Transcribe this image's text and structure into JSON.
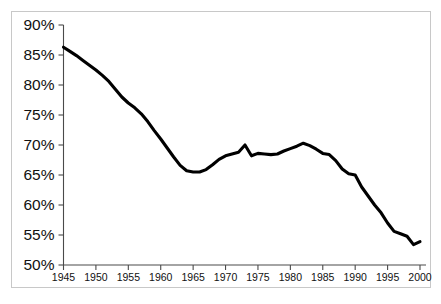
{
  "chart_data": {
    "type": "line",
    "title": "",
    "subtitle": "",
    "xlabel": "",
    "ylabel": "",
    "xlim": [
      1945,
      2000
    ],
    "ylim": [
      50,
      90
    ],
    "grid": false,
    "legend": null,
    "legend_position": "none",
    "line_color": "#000000",
    "axis_color": "#4a4a4a",
    "border_color": "#c8c8c8",
    "background_color": "#ffffff",
    "y_tick_labels": [
      "90%",
      "85%",
      "80%",
      "75%",
      "70%",
      "65%",
      "60%",
      "55%",
      "50%"
    ],
    "y_tick_values": [
      90,
      85,
      80,
      75,
      70,
      65,
      60,
      55,
      50
    ],
    "x_tick_labels": [
      "1945",
      "1950",
      "1955",
      "1960",
      "1965",
      "1970",
      "1975",
      "1980",
      "1985",
      "1990",
      "1995",
      "2000"
    ],
    "x_tick_values": [
      1945,
      1950,
      1955,
      1960,
      1965,
      1970,
      1975,
      1980,
      1985,
      1990,
      1995,
      2000
    ],
    "x": [
      1945,
      1946,
      1947,
      1948,
      1949,
      1950,
      1951,
      1952,
      1953,
      1954,
      1955,
      1956,
      1957,
      1958,
      1959,
      1960,
      1961,
      1962,
      1963,
      1964,
      1965,
      1966,
      1967,
      1968,
      1969,
      1970,
      1971,
      1972,
      1973,
      1974,
      1975,
      1976,
      1977,
      1978,
      1979,
      1980,
      1981,
      1982,
      1983,
      1984,
      1985,
      1986,
      1987,
      1988,
      1989,
      1990,
      1991,
      1992,
      1993,
      1994,
      1995,
      1996,
      1997,
      1998,
      1999,
      2000
    ],
    "y": [
      86.3,
      85.6,
      84.9,
      84.1,
      83.3,
      82.5,
      81.6,
      80.6,
      79.3,
      78.0,
      77.0,
      76.2,
      75.2,
      73.9,
      72.4,
      71.0,
      69.5,
      68.0,
      66.6,
      65.7,
      65.5,
      65.5,
      65.9,
      66.7,
      67.6,
      68.2,
      68.5,
      68.8,
      70.0,
      68.2,
      68.6,
      68.5,
      68.4,
      68.5,
      69.0,
      69.4,
      69.8,
      70.3,
      69.9,
      69.3,
      68.6,
      68.4,
      67.4,
      66.0,
      65.2,
      65.0,
      63.0,
      61.5,
      60.0,
      58.7,
      57.0,
      55.6,
      55.2,
      54.8,
      53.4,
      53.9
    ],
    "series": [
      {
        "name": "value",
        "values": [
          86.3,
          85.6,
          84.9,
          84.1,
          83.3,
          82.5,
          81.6,
          80.6,
          79.3,
          78.0,
          77.0,
          76.2,
          75.2,
          73.9,
          72.4,
          71.0,
          69.5,
          68.0,
          66.6,
          65.7,
          65.5,
          65.5,
          65.9,
          66.7,
          67.6,
          68.2,
          68.5,
          68.8,
          70.0,
          68.2,
          68.6,
          68.5,
          68.4,
          68.5,
          69.0,
          69.4,
          69.8,
          70.3,
          69.9,
          69.3,
          68.6,
          68.4,
          67.4,
          66.0,
          65.2,
          65.0,
          63.0,
          61.5,
          60.0,
          58.7,
          57.0,
          55.6,
          55.2,
          54.8,
          53.4,
          53.9
        ]
      }
    ]
  }
}
